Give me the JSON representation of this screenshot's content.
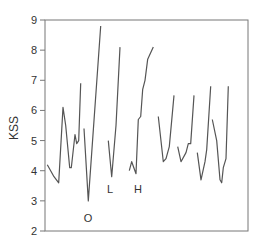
{
  "chart_data": {
    "type": "line",
    "title": "",
    "xlabel": "",
    "ylabel": "KSS",
    "ylim": [
      2,
      9
    ],
    "yticks": [
      2,
      3,
      4,
      5,
      6,
      7,
      8,
      9
    ],
    "grid": false,
    "legend": null,
    "line_color": "#555555",
    "series": [
      {
        "name": "segment-1",
        "points": [
          [
            47.3,
            4.2
          ],
          [
            54,
            3.8
          ],
          [
            58.7,
            3.6
          ],
          [
            63,
            6.1
          ],
          [
            65.7,
            5.5
          ],
          [
            69.7,
            4.1
          ],
          [
            71.3,
            4.1
          ],
          [
            75,
            5.2
          ],
          [
            76.7,
            4.9
          ],
          [
            78.7,
            5.0
          ],
          [
            80.7,
            6.9
          ]
        ]
      },
      {
        "name": "segment-2",
        "points": [
          [
            84,
            5.4
          ],
          [
            88.3,
            3.0
          ],
          [
            100.7,
            8.8
          ]
        ]
      },
      {
        "name": "segment-3",
        "points": [
          [
            108.3,
            5.0
          ],
          [
            111.7,
            3.8
          ],
          [
            116,
            5.5
          ],
          [
            120,
            8.1
          ]
        ]
      },
      {
        "name": "segment-4",
        "points": [
          [
            129.3,
            4.0
          ],
          [
            131.7,
            4.3
          ],
          [
            136,
            3.9
          ],
          [
            138.3,
            5.7
          ],
          [
            140.7,
            5.8
          ],
          [
            142.7,
            6.7
          ],
          [
            145,
            7.0
          ],
          [
            147.7,
            7.7
          ],
          [
            153.3,
            8.1
          ]
        ]
      },
      {
        "name": "segment-5",
        "points": [
          [
            158.3,
            5.8
          ],
          [
            163.3,
            4.3
          ],
          [
            166,
            4.4
          ],
          [
            169.3,
            4.8
          ],
          [
            174,
            6.5
          ]
        ]
      },
      {
        "name": "segment-6",
        "points": [
          [
            177.7,
            4.8
          ],
          [
            181,
            4.3
          ],
          [
            186,
            4.6
          ],
          [
            188.3,
            4.9
          ],
          [
            190.7,
            4.9
          ],
          [
            194,
            6.5
          ]
        ]
      },
      {
        "name": "segment-7",
        "points": [
          [
            197.3,
            4.6
          ],
          [
            201,
            3.7
          ],
          [
            205,
            4.3
          ],
          [
            206.7,
            4.7
          ],
          [
            210.7,
            6.8
          ]
        ]
      },
      {
        "name": "segment-8",
        "points": [
          [
            212.3,
            5.7
          ],
          [
            216.7,
            5.0
          ],
          [
            220,
            3.7
          ],
          [
            221.7,
            3.6
          ],
          [
            223.3,
            4.1
          ],
          [
            226,
            4.4
          ],
          [
            228.3,
            6.8
          ]
        ]
      }
    ],
    "annotations": [
      {
        "text": "O",
        "x": 88,
        "y": 2.6
      },
      {
        "text": "L",
        "x": 110,
        "y": 3.55
      },
      {
        "text": "H",
        "x": 138,
        "y": 3.55
      }
    ]
  },
  "axis": {
    "ylabel": "KSS",
    "ytick_labels": [
      "2",
      "3",
      "4",
      "5",
      "6",
      "7",
      "8",
      "9"
    ]
  },
  "annotations": {
    "o": "O",
    "l": "L",
    "h": "H"
  }
}
